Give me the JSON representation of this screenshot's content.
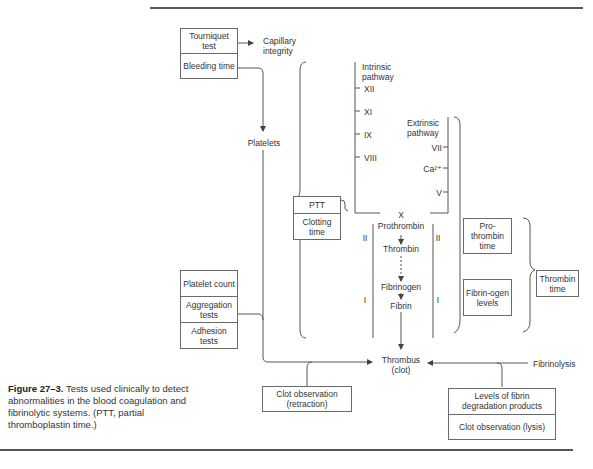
{
  "figure": {
    "caption_label": "Figure 27–3.",
    "caption_text": " Tests used clinically to detect abnormalities in the blood coagulation and fibrinolytic systems. (PTT, partial thromboplastin time.)"
  },
  "tests": {
    "tourniquet": "Tourniquet test",
    "bleeding": "Bleeding time",
    "ptt": "PTT",
    "clotting": "Clotting time",
    "platelet_count": "Platelet count",
    "aggregation": "Aggregation tests",
    "adhesion": "Adhesion tests",
    "prothrombin_time": "Pro-thrombin time",
    "fibrinogen_levels": "Fibrin-ogen levels",
    "thrombin_time": "Thrombin time",
    "clot_retraction": "Clot observation (retraction)",
    "fdp_levels": "Levels of fibrin degradation products",
    "clot_lysis": "Clot observation (lysis)"
  },
  "labels": {
    "capillary": "Capillary integrity",
    "platelets": "Platelets",
    "intrinsic": "Intrinsic pathway",
    "extrinsic": "Extrinsic pathway",
    "factor_xii": "XII",
    "factor_xi": "XI",
    "factor_ix": "IX",
    "factor_viii": "VIII",
    "factor_vii": "VII",
    "calcium": "Ca²⁺",
    "factor_v": "V",
    "factor_x": "X",
    "prothrombin": "Prothrombin",
    "thrombin": "Thrombin",
    "fibrinogen": "Fibrinogen",
    "fibrin": "Fibrin",
    "roman_ii": "II",
    "roman_i": "I",
    "thrombus": "Thrombus (clot)",
    "fibrinolysis": "Fibrinolysis"
  },
  "colors": {
    "line": "#555555",
    "box_border": "#6a6a6a",
    "text": "#333333"
  }
}
